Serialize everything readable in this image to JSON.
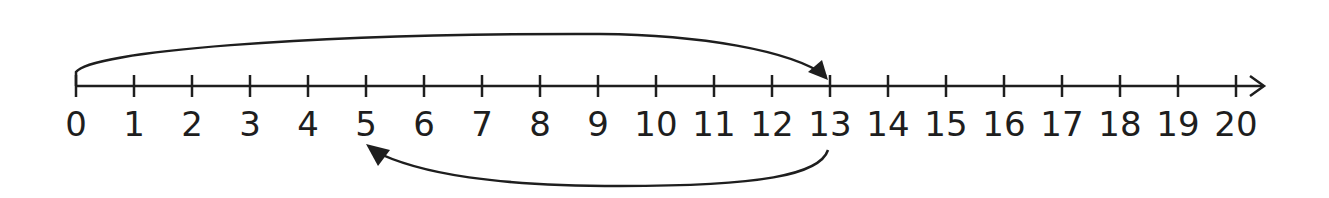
{
  "diagram": {
    "type": "number-line",
    "min": 0,
    "max": 20,
    "step": 1,
    "tick_labels": [
      "0",
      "1",
      "2",
      "3",
      "4",
      "5",
      "6",
      "7",
      "8",
      "9",
      "10",
      "11",
      "12",
      "13",
      "14",
      "15",
      "16",
      "17",
      "18",
      "19",
      "20"
    ],
    "jumps": [
      {
        "from": 0,
        "to": 13,
        "side": "above",
        "direction": "forward"
      },
      {
        "from": 13,
        "to": 5,
        "side": "below",
        "direction": "backward"
      }
    ],
    "line_color": "#1e1e1e",
    "arrow_end": "right"
  }
}
